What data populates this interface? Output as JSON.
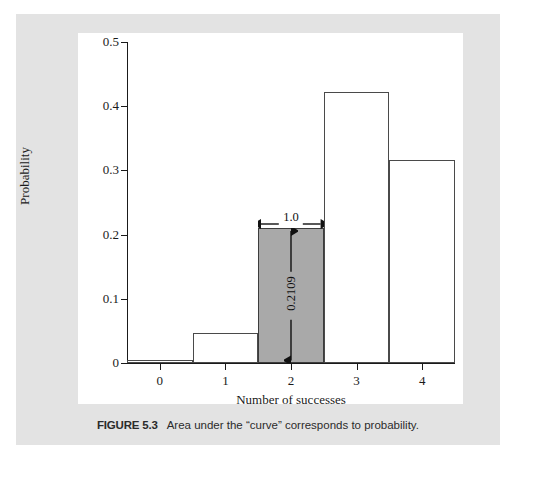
{
  "figure": {
    "caption_label": "FIGURE 5.3",
    "caption_text": "Area under the “curve” corresponds to probability."
  },
  "chart_data": {
    "type": "bar",
    "title": "",
    "subtitle": "",
    "xlabel": "Number of successes",
    "ylabel": "Probability",
    "categories": [
      "0",
      "1",
      "2",
      "3",
      "4"
    ],
    "values": [
      0.0039,
      0.0469,
      0.2109,
      0.4219,
      0.3164
    ],
    "xlim": [
      -0.5,
      4.5
    ],
    "ylim": [
      0,
      0.5
    ],
    "x_ticks": [
      "0",
      "1",
      "2",
      "3",
      "4"
    ],
    "y_ticks": [
      "0",
      "0.1",
      "0.2",
      "0.3",
      "0.4",
      "0.5"
    ],
    "grid": false,
    "legend": "none",
    "bar_width": 1.0,
    "highlighted_category": "2",
    "highlight_color": "#a9a9a9",
    "bar_face_color": "#ffffff",
    "bar_edge_color": "#4a4a4a",
    "annotations": [
      {
        "name": "bar-width-annotation",
        "text": "1.0",
        "orientation": "horizontal"
      },
      {
        "name": "bar-height-annotation",
        "text": "0.2109",
        "orientation": "vertical"
      }
    ]
  },
  "colors": {
    "mat": "#e3e3e3",
    "panel": "#ffffff",
    "ink": "#1a1a1a"
  }
}
